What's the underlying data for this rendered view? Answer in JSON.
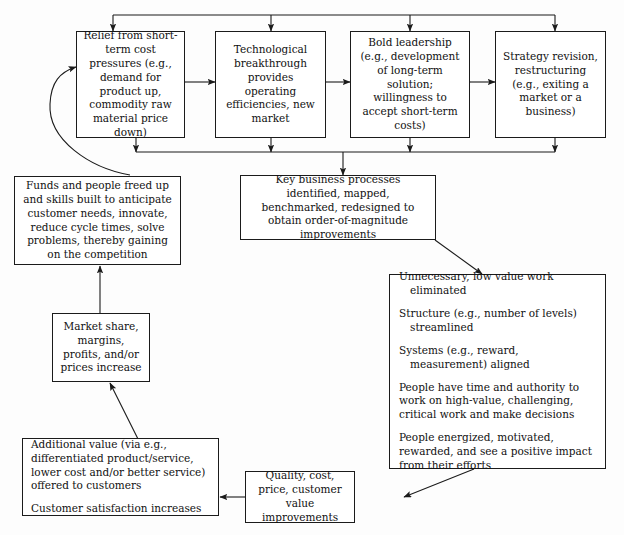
{
  "diagram": {
    "background_color": "#fdfdfd",
    "line_color": "#1b1b1b",
    "text_color": "#111111",
    "nodes": {
      "relief": {
        "text": "Relief from short-term cost pressures (e.g., demand for product up, commodity raw material price down)"
      },
      "technological": {
        "text": "Technological breakthrough provides operating efficiencies, new market"
      },
      "leadership": {
        "text": "Bold leadership (e.g., development of long-term solution; willingness to accept short-term costs)"
      },
      "strategy": {
        "text": "Strategy revision, restructuring (e.g., exiting a market or a business)"
      },
      "funds": {
        "text": "Funds and people freed up and skills built to anticipate customer needs, innovate, reduce cycle times, solve problems, thereby gaining on the competition"
      },
      "processes": {
        "text": "Key business processes identified, mapped, benchmarked, redesigned to obtain order-of-magnitude improvements"
      },
      "outcomes": {
        "line1": "Unnecessary, low value work eliminated",
        "line2": "Structure (e.g., number of levels) streamlined",
        "line3": "Systems (e.g., reward, measurement) aligned",
        "line4": "People have time and authority to work on high-value, challenging, critical work and make decisions",
        "line5": "People energized, motivated, rewarded, and see a positive impact from their efforts"
      },
      "market_share": {
        "text": "Market share, margins, profits, and/or prices increase"
      },
      "additional_value": {
        "line1": "Additional value (via e.g., differentiated product/service, lower cost and/or better service) offered to customers",
        "line2": "Customer satisfaction increases"
      },
      "quality": {
        "text": "Quality, cost, price, customer value improvements"
      }
    },
    "edges": [
      {
        "name": "bus-to-relief",
        "type": "arrow-down"
      },
      {
        "name": "bus-to-technological",
        "type": "arrow-down"
      },
      {
        "name": "bus-to-leadership",
        "type": "arrow-down"
      },
      {
        "name": "bus-to-strategy",
        "type": "arrow-down"
      },
      {
        "name": "relief-technological-bidirectional",
        "type": "double-arrow"
      },
      {
        "name": "technological-leadership-bidirectional",
        "type": "double-arrow"
      },
      {
        "name": "leadership-strategy-bidirectional",
        "type": "double-arrow"
      },
      {
        "name": "top-row-to-collector",
        "type": "arrow-down"
      },
      {
        "name": "collector-to-processes",
        "type": "arrow-down"
      },
      {
        "name": "funds-to-relief-curve",
        "type": "curved-arrow"
      },
      {
        "name": "processes-to-outcomes",
        "type": "diagonal-arrow"
      },
      {
        "name": "market-share-to-funds",
        "type": "arrow-up"
      },
      {
        "name": "additional-value-to-market-share",
        "type": "diagonal-arrow"
      },
      {
        "name": "quality-to-additional-value",
        "type": "arrow-left"
      },
      {
        "name": "outcomes-to-quality",
        "type": "diagonal-arrow"
      }
    ]
  }
}
